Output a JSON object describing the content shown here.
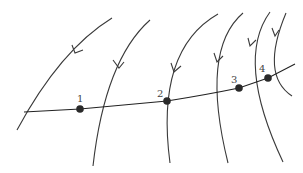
{
  "diagram": {
    "colors": {
      "line": "#3a3a3a",
      "point": "#2a2a2a",
      "background": "#ffffff"
    },
    "points": [
      {
        "label": "1",
        "x": 80,
        "y": 109
      },
      {
        "label": "2",
        "x": 167,
        "y": 101
      },
      {
        "label": "3",
        "x": 239,
        "y": 88
      },
      {
        "label": "4",
        "x": 268,
        "y": 78
      }
    ],
    "field_line_count": 6
  }
}
